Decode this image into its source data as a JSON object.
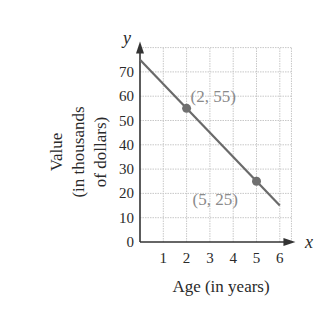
{
  "chart_data": {
    "type": "line",
    "title": "",
    "xlabel": "Age (in years)",
    "ylabel_lines": [
      "Value",
      "(in thousands",
      "of dollars)"
    ],
    "ylabel": "Value (in thousands of dollars)",
    "x_axis_var": "x",
    "y_axis_var": "y",
    "xlim": [
      0,
      6.5
    ],
    "ylim": [
      0,
      80
    ],
    "x_ticks": [
      1,
      2,
      3,
      4,
      5,
      6
    ],
    "y_ticks": [
      0,
      10,
      20,
      30,
      40,
      50,
      60,
      70
    ],
    "x_tick_labels": [
      "1",
      "2",
      "3",
      "4",
      "5",
      "6"
    ],
    "y_tick_labels": [
      "0",
      "10",
      "20",
      "30",
      "40",
      "50",
      "60",
      "70"
    ],
    "grid": true,
    "legend": null,
    "series": [
      {
        "name": "Value line",
        "x": [
          0,
          6
        ],
        "y": [
          75,
          15
        ],
        "equation": "y = -10x + 75",
        "color": "#6a6a6a"
      }
    ],
    "points": [
      {
        "x": 2,
        "y": 55,
        "label": "(2, 55)"
      },
      {
        "x": 5,
        "y": 25,
        "label": "(5, 25)"
      }
    ],
    "annotations": [
      "(2, 55)",
      "(5, 25)"
    ],
    "colors": {
      "line": "#6a6a6a",
      "point": "#707070",
      "point_label": "#8a8a8a",
      "grid": "#c8c8c8",
      "axis": "#333333"
    }
  }
}
